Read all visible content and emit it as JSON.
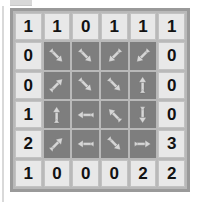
{
  "puzzle": {
    "name": "arrow-number-grid-puzzle",
    "rows": 6,
    "cols": 6,
    "colors": {
      "clue_cell_bg": "#e8e8e8",
      "arrow_cell_bg": "#7e7e7e",
      "frame_border": "#9a9a9a",
      "grid_gap": "#b9b9b9",
      "clue_text": "#121212",
      "arrow_fill": "#d6d6d6",
      "arrow_outline": "#6a6a6a"
    },
    "cells": [
      [
        {
          "kind": "clue",
          "value": "1"
        },
        {
          "kind": "clue",
          "value": "1"
        },
        {
          "kind": "clue",
          "value": "0"
        },
        {
          "kind": "clue",
          "value": "1"
        },
        {
          "kind": "clue",
          "value": "1"
        },
        {
          "kind": "clue",
          "value": "1"
        }
      ],
      [
        {
          "kind": "clue",
          "value": "0"
        },
        {
          "kind": "arrow",
          "direction": "down-right",
          "glyph": "↘"
        },
        {
          "kind": "arrow",
          "direction": "down-right",
          "glyph": "↘"
        },
        {
          "kind": "arrow",
          "direction": "down-left",
          "glyph": "↙"
        },
        {
          "kind": "arrow",
          "direction": "down-left",
          "glyph": "↙"
        },
        {
          "kind": "clue",
          "value": "0"
        }
      ],
      [
        {
          "kind": "clue",
          "value": "0"
        },
        {
          "kind": "arrow",
          "direction": "up-right",
          "glyph": "↗"
        },
        {
          "kind": "arrow",
          "direction": "down-right",
          "glyph": "↘"
        },
        {
          "kind": "arrow",
          "direction": "down-right",
          "glyph": "↘"
        },
        {
          "kind": "arrow",
          "direction": "up",
          "glyph": "↑"
        },
        {
          "kind": "clue",
          "value": "0"
        }
      ],
      [
        {
          "kind": "clue",
          "value": "1"
        },
        {
          "kind": "arrow",
          "direction": "up",
          "glyph": "↑"
        },
        {
          "kind": "arrow",
          "direction": "left",
          "glyph": "←"
        },
        {
          "kind": "arrow",
          "direction": "up-left",
          "glyph": "↖"
        },
        {
          "kind": "arrow",
          "direction": "down",
          "glyph": "↓"
        },
        {
          "kind": "clue",
          "value": "0"
        }
      ],
      [
        {
          "kind": "clue",
          "value": "2"
        },
        {
          "kind": "arrow",
          "direction": "up-right",
          "glyph": "↗"
        },
        {
          "kind": "arrow",
          "direction": "left",
          "glyph": "←"
        },
        {
          "kind": "arrow",
          "direction": "down-right",
          "glyph": "↘"
        },
        {
          "kind": "arrow",
          "direction": "right",
          "glyph": "→"
        },
        {
          "kind": "clue",
          "value": "3"
        }
      ],
      [
        {
          "kind": "clue",
          "value": "1"
        },
        {
          "kind": "clue",
          "value": "0"
        },
        {
          "kind": "clue",
          "value": "0"
        },
        {
          "kind": "clue",
          "value": "0"
        },
        {
          "kind": "clue",
          "value": "2"
        },
        {
          "kind": "clue",
          "value": "2"
        }
      ]
    ]
  }
}
